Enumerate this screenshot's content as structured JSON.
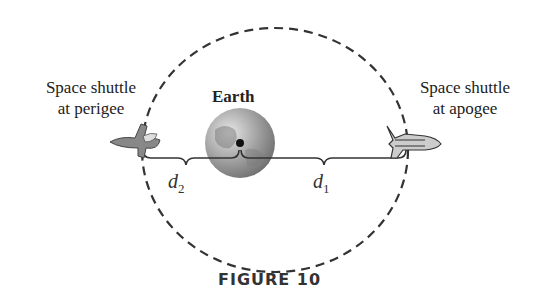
{
  "figure": {
    "caption": "FIGURE 10",
    "labels": {
      "perigee_line1": "Space shuttle",
      "perigee_line2": "at perigee",
      "apogee_line1": "Space shuttle",
      "apogee_line2": "at apogee",
      "earth": "Earth"
    },
    "distances": {
      "d2": {
        "var": "d",
        "sub": "2"
      },
      "d1": {
        "var": "d",
        "sub": "1"
      }
    },
    "colors": {
      "orbit": "#333333",
      "earth": "#8a8a8a",
      "text": "#222222"
    }
  }
}
